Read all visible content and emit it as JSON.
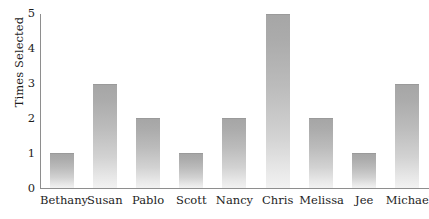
{
  "chart_data": {
    "type": "bar",
    "title": "",
    "subtitle": "",
    "xlabel": "",
    "ylabel": "Times Selected",
    "categories": [
      "Bethany",
      "Susan",
      "Pablo",
      "Scott",
      "Nancy",
      "Chris",
      "Melissa",
      "Jee",
      "Michael"
    ],
    "values": [
      1,
      3,
      2,
      1,
      2,
      5,
      2,
      1,
      3
    ],
    "ylim": [
      0,
      5
    ],
    "yticks": [
      0,
      1,
      2,
      3,
      4,
      5
    ],
    "ytick_labels": [
      "0",
      "1",
      "2",
      "3",
      "4",
      "5"
    ],
    "grid": false,
    "legend": null,
    "annotations": [],
    "bar_color_top": "#a6a6a6",
    "bar_color_bottom": "#f2f2f2",
    "axis_color": "#8e8e8e",
    "text_color": "#1d1d1d",
    "background_color": "#ffffff"
  }
}
